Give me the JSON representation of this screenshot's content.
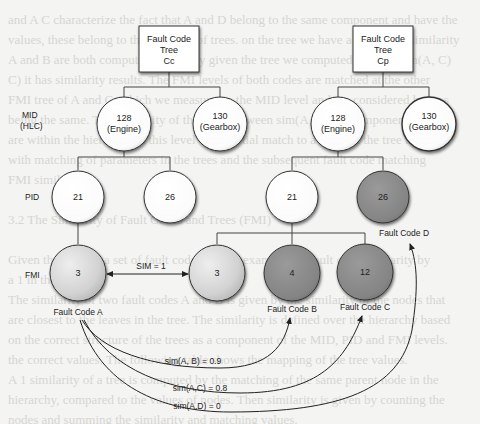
{
  "diagram": {
    "trees": [
      {
        "title": [
          "Fault Code",
          "Tree",
          "Cc"
        ]
      },
      {
        "title": [
          "Fault Code",
          "Tree",
          "Cp"
        ]
      }
    ],
    "level_labels": {
      "mid": [
        "MID",
        "(HLC)"
      ],
      "pid": "PID",
      "fmi": "FMI"
    },
    "nodes": {
      "cc_mid_engine": [
        "128",
        "(Engine)"
      ],
      "cc_mid_gearbox": [
        "130",
        "(Gearbox)"
      ],
      "cp_mid_engine": [
        "128",
        "(Engine)"
      ],
      "cp_mid_gearbox": [
        "130",
        "(Gearbox)"
      ],
      "cc_pid_21": "21",
      "cc_pid_26": "26",
      "cp_pid_21": "21",
      "cp_pid_26": "26",
      "cc_fmi_3": "3",
      "cp_fmi_3": "3",
      "cp_fmi_4": "4",
      "cp_fmi_12": "12"
    },
    "fault_codes": {
      "a": "Fault Code A",
      "b": "Fault Code B",
      "c": "Fault Code C",
      "d": "Fault Code D"
    },
    "relations": {
      "sim_equal": "SIM = 1",
      "sim_ab": "sim(A, B) = 0.9",
      "sim_ac": "sim(A,C) = 0.8",
      "sim_ad": "sim(A,D) = 0"
    },
    "colors": {
      "white_node": "#ffffff",
      "light_node": "#d8d8d8",
      "dark_node": "#8a8a8a",
      "background": "#f4f4f2"
    }
  }
}
